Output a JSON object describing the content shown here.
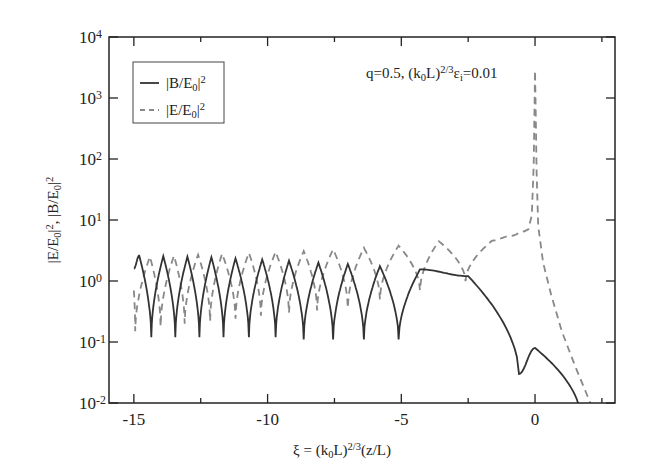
{
  "chart_data": {
    "type": "line",
    "title": "",
    "annotation": {
      "text_parts": [
        "q=0.5,  (k",
        "0",
        "L)",
        "2/3",
        "ε",
        "i",
        "=0.01"
      ],
      "plain": "q=0.5, (k0L)^(2/3) εi=0.01"
    },
    "xlabel": "ξ = (k0L)^(2/3)(z/L)",
    "xlabel_parts": [
      "ξ = (k",
      "0",
      "L)",
      "2/3",
      "(z/L)"
    ],
    "ylabel": "|E/E0|^2,  |B/E0|^2",
    "ylabel_parts": [
      "|E/E",
      "0",
      "|",
      "2",
      ",  |B/E",
      "0",
      "|",
      "2"
    ],
    "xlim": [
      -15.93,
      2.99
    ],
    "ylim": [
      0.01,
      10000
    ],
    "yscale": "log",
    "xticks": [
      -15,
      -10,
      -5,
      0
    ],
    "xtick_labels": [
      "-15",
      "-10",
      "-5",
      "0"
    ],
    "yticks": [
      0.01,
      0.1,
      1,
      10,
      100,
      1000,
      10000
    ],
    "ytick_labels": [
      {
        "base": "10",
        "exp": "-2"
      },
      {
        "base": "10",
        "exp": "-1"
      },
      {
        "base": "10",
        "exp": "0"
      },
      {
        "base": "10",
        "exp": "1"
      },
      {
        "base": "10",
        "exp": "2"
      },
      {
        "base": "10",
        "exp": "3"
      },
      {
        "base": "10",
        "exp": "4"
      }
    ],
    "grid": false,
    "legend": {
      "position": "upper-left",
      "entries": [
        {
          "label_parts": [
            "|B/E",
            "0",
            "|",
            "2"
          ],
          "label": "|B/E0|^2",
          "style": "solid"
        },
        {
          "label_parts": [
            "|E/E",
            "0",
            "|",
            "2"
          ],
          "label": "|E/E0|^2",
          "style": "dashed"
        }
      ]
    },
    "series": [
      {
        "name": "|B/E0|^2",
        "style": "solid",
        "color": "#333333",
        "description": "Oscillating Airy-like pattern, peaks ~2.5 decaying to ~1.2 near ξ=-2.5, minima ~0.12; then falls to ~0.03 at ξ≈-0.6, second bump ~0.08 at ξ≈0, drops below 0.01 near ξ≈1.5",
        "peaks": [
          {
            "x": -14.8,
            "y": 2.6
          },
          {
            "x": -13.9,
            "y": 2.55
          },
          {
            "x": -13.0,
            "y": 2.5
          },
          {
            "x": -12.1,
            "y": 2.45
          },
          {
            "x": -11.2,
            "y": 2.35
          },
          {
            "x": -10.2,
            "y": 2.25
          },
          {
            "x": -9.2,
            "y": 2.15
          },
          {
            "x": -8.1,
            "y": 2.0
          },
          {
            "x": -7.0,
            "y": 1.9
          },
          {
            "x": -5.8,
            "y": 1.75
          },
          {
            "x": -4.3,
            "y": 1.55
          },
          {
            "x": -2.5,
            "y": 1.2
          },
          {
            "x": 0.0,
            "y": 0.08
          }
        ],
        "minima": [
          {
            "x": -14.35,
            "y": 0.12
          },
          {
            "x": -13.45,
            "y": 0.12
          },
          {
            "x": -12.55,
            "y": 0.12
          },
          {
            "x": -11.65,
            "y": 0.12
          },
          {
            "x": -10.7,
            "y": 0.12
          },
          {
            "x": -9.7,
            "y": 0.12
          },
          {
            "x": -8.65,
            "y": 0.11
          },
          {
            "x": -7.55,
            "y": 0.11
          },
          {
            "x": -6.4,
            "y": 0.11
          },
          {
            "x": -5.1,
            "y": 0.11
          },
          {
            "x": -0.6,
            "y": 0.03
          }
        ]
      },
      {
        "name": "|E/E0|^2",
        "style": "dashed",
        "color": "#888888",
        "description": "Oscillation in antiphase: peaks ~2.6 rising to ~4.5 at ξ≈-1.6, minima ~0.15–0.4; plateau ~6–7 near ξ≈-0.5, sharp resonance peak ~2500 at ξ=0, then steep fall below 0.01 near ξ≈2",
        "peaks": [
          {
            "x": -14.4,
            "y": 2.5
          },
          {
            "x": -13.5,
            "y": 2.6
          },
          {
            "x": -12.6,
            "y": 2.7
          },
          {
            "x": -11.7,
            "y": 2.8
          },
          {
            "x": -10.7,
            "y": 2.9
          },
          {
            "x": -9.7,
            "y": 3.0
          },
          {
            "x": -8.65,
            "y": 3.1
          },
          {
            "x": -7.55,
            "y": 3.3
          },
          {
            "x": -6.4,
            "y": 3.5
          },
          {
            "x": -5.1,
            "y": 3.8
          },
          {
            "x": -3.6,
            "y": 4.5
          },
          {
            "x": -0.4,
            "y": 6.5
          },
          {
            "x": 0.0,
            "y": 2500
          }
        ],
        "minima": [
          {
            "x": -14.95,
            "y": 0.15
          },
          {
            "x": -14.0,
            "y": 0.18
          },
          {
            "x": -13.1,
            "y": 0.2
          },
          {
            "x": -12.15,
            "y": 0.22
          },
          {
            "x": -11.2,
            "y": 0.24
          },
          {
            "x": -10.25,
            "y": 0.27
          },
          {
            "x": -9.2,
            "y": 0.3
          },
          {
            "x": -8.15,
            "y": 0.33
          },
          {
            "x": -7.0,
            "y": 0.36
          },
          {
            "x": -5.8,
            "y": 0.5
          },
          {
            "x": -4.3,
            "y": 0.7
          },
          {
            "x": -2.6,
            "y": 1.0
          }
        ]
      }
    ]
  }
}
